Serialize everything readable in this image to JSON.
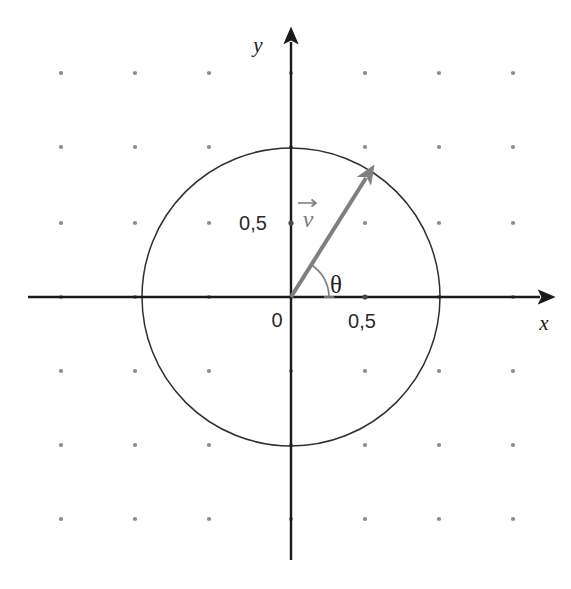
{
  "figure": {
    "background_color": "#ffffff"
  },
  "axes": {
    "x_label": "x",
    "y_label": "y",
    "origin_label": "0",
    "x_tick_label": "0,5",
    "y_tick_label": "0,5",
    "axis_color": "#1a1a1a",
    "origin_px": {
      "x": 291,
      "y": 297
    },
    "unit_px": 148,
    "x_axis_start_px": 28,
    "x_axis_end_px": 548,
    "y_axis_start_px": 33,
    "y_axis_end_px": 560
  },
  "grid": {
    "dot_color": "#8c8c8c",
    "dot_radius_px": 2.1,
    "spacing_px": 74,
    "x_positions": [
      61,
      135,
      209,
      291,
      365,
      439,
      513
    ],
    "y_positions": [
      73,
      147,
      223,
      297,
      371,
      445,
      519
    ]
  },
  "circle": {
    "center_px": {
      "x": 291,
      "y": 297
    },
    "radius_px": 149,
    "stroke_color": "#2e2e2e",
    "stroke_width": 1.5,
    "fill": "none",
    "radius_units": 1
  },
  "vector": {
    "label": "v",
    "color": "#7f7f7f",
    "stroke_width": 4,
    "tail_px": {
      "x": 291,
      "y": 297
    },
    "tip_px": {
      "x": 366,
      "y": 178
    },
    "magnitude_units": 0.95,
    "angle_degrees": 58,
    "components_units": {
      "x": 0.507,
      "y": 0.804
    }
  },
  "angle": {
    "symbol": "θ",
    "arc_color": "#7f7f7f",
    "arc_radius_px": 38,
    "arc_start_degrees": 0,
    "arc_end_degrees": 58
  },
  "ticks": {
    "x_tick_px": {
      "x": 365,
      "y": 297
    },
    "y_tick_px": {
      "x": 291,
      "y": 223
    },
    "tick_color": "#4a4a4a"
  }
}
